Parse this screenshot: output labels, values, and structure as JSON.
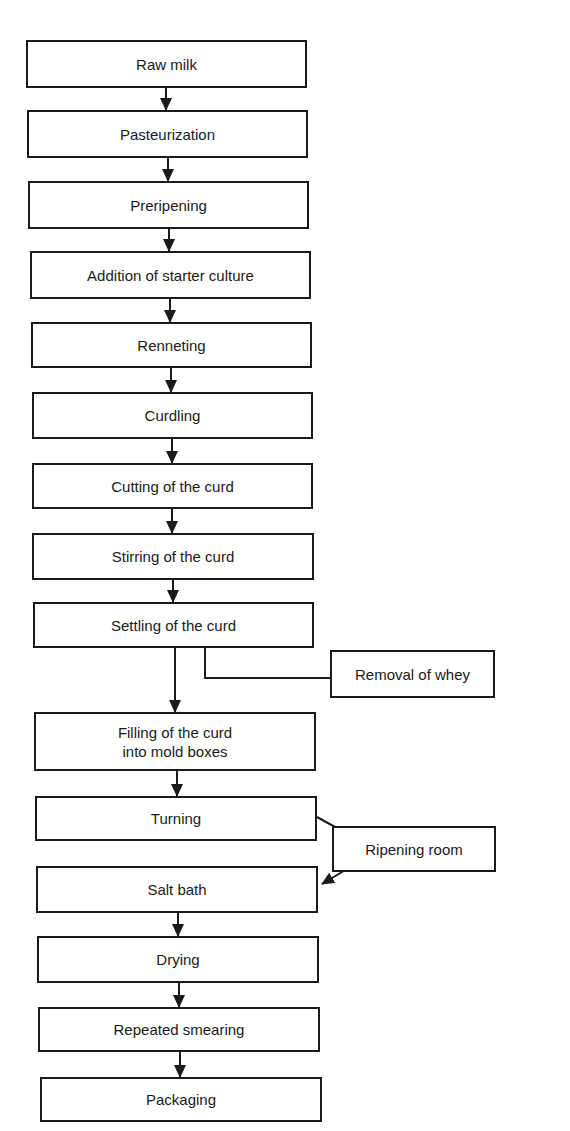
{
  "diagram": {
    "type": "flowchart",
    "title": "",
    "steps": [
      {
        "id": "raw-milk",
        "label": "Raw milk"
      },
      {
        "id": "pasteurization",
        "label": "Pasteurization"
      },
      {
        "id": "preripening",
        "label": "Preripening"
      },
      {
        "id": "addition-of-starter-culture",
        "label": "Addition of starter culture"
      },
      {
        "id": "renneting",
        "label": "Renneting"
      },
      {
        "id": "curdling",
        "label": "Curdling"
      },
      {
        "id": "cutting-of-the-curd",
        "label": "Cutting of the curd"
      },
      {
        "id": "stirring-of-the-curd",
        "label": "Stirring of the curd"
      },
      {
        "id": "settling-of-the-curd",
        "label": "Settling of the curd"
      },
      {
        "id": "filling-of-the-curd",
        "label": "Filling of the curd\ninto mold boxes"
      },
      {
        "id": "turning",
        "label": "Turning"
      },
      {
        "id": "salt-bath",
        "label": "Salt bath"
      },
      {
        "id": "drying",
        "label": "Drying"
      },
      {
        "id": "repeated-smearing",
        "label": "Repeated smearing"
      },
      {
        "id": "packaging",
        "label": "Packaging"
      }
    ],
    "side_nodes": [
      {
        "id": "removal-of-whey",
        "label": "Removal of whey"
      },
      {
        "id": "ripening-room",
        "label": "Ripening room"
      }
    ],
    "edges": [
      [
        "raw-milk",
        "pasteurization"
      ],
      [
        "pasteurization",
        "preripening"
      ],
      [
        "preripening",
        "addition-of-starter-culture"
      ],
      [
        "addition-of-starter-culture",
        "renneting"
      ],
      [
        "renneting",
        "curdling"
      ],
      [
        "curdling",
        "cutting-of-the-curd"
      ],
      [
        "cutting-of-the-curd",
        "stirring-of-the-curd"
      ],
      [
        "stirring-of-the-curd",
        "settling-of-the-curd"
      ],
      [
        "settling-of-the-curd",
        "filling-of-the-curd"
      ],
      [
        "settling-of-the-curd",
        "removal-of-whey"
      ],
      [
        "filling-of-the-curd",
        "turning"
      ],
      [
        "turning",
        "ripening-room"
      ],
      [
        "ripening-room",
        "salt-bath"
      ],
      [
        "salt-bath",
        "drying"
      ],
      [
        "drying",
        "repeated-smearing"
      ],
      [
        "repeated-smearing",
        "packaging"
      ]
    ]
  }
}
